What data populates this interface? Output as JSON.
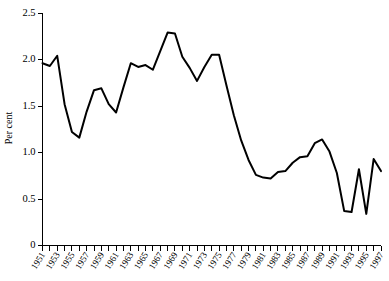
{
  "chart_data": {
    "type": "line",
    "title": "",
    "xlabel": "",
    "ylabel": "Per cent",
    "ylim": [
      0,
      2.5
    ],
    "xlim": [
      1951,
      1997
    ],
    "yticks": [
      "0",
      "0.5",
      "1.0",
      "1.5",
      "2.0",
      "2.5"
    ],
    "ytick_values": [
      0,
      0.5,
      1.0,
      1.5,
      2.0,
      2.5
    ],
    "grid": false,
    "legend": "none",
    "x": [
      1951,
      1952,
      1953,
      1954,
      1955,
      1956,
      1957,
      1958,
      1959,
      1960,
      1961,
      1962,
      1963,
      1964,
      1965,
      1966,
      1967,
      1968,
      1969,
      1970,
      1971,
      1972,
      1973,
      1974,
      1975,
      1976,
      1977,
      1978,
      1979,
      1980,
      1981,
      1982,
      1983,
      1984,
      1985,
      1986,
      1987,
      1988,
      1989,
      1990,
      1991,
      1992,
      1993,
      1994,
      1995,
      1996,
      1997
    ],
    "values": [
      1.96,
      1.93,
      2.04,
      1.52,
      1.22,
      1.16,
      1.44,
      1.67,
      1.69,
      1.52,
      1.43,
      1.7,
      1.96,
      1.92,
      1.94,
      1.89,
      2.09,
      2.29,
      2.28,
      2.03,
      1.91,
      1.77,
      1.92,
      2.05,
      2.05,
      1.72,
      1.4,
      1.13,
      0.92,
      0.76,
      0.73,
      0.72,
      0.79,
      0.8,
      0.89,
      0.95,
      0.96,
      1.1,
      1.14,
      1.01,
      0.78,
      0.37,
      0.36,
      0.82,
      0.34,
      0.93,
      0.8
    ],
    "series_note": "single unlabeled black line series",
    "xtick_labels": [
      "1951",
      "1953",
      "1955",
      "1957",
      "1959",
      "1961",
      "1963",
      "1965",
      "1967",
      "1969",
      "1971",
      "1973",
      "1975",
      "1977",
      "1979",
      "1981",
      "1983",
      "1985",
      "1987",
      "1989",
      "1991",
      "1993",
      "1995",
      "1997"
    ],
    "xtick_label_years": [
      1951,
      1953,
      1955,
      1957,
      1959,
      1961,
      1963,
      1965,
      1967,
      1969,
      1971,
      1973,
      1975,
      1977,
      1979,
      1981,
      1983,
      1985,
      1987,
      1989,
      1991,
      1993,
      1995,
      1997
    ],
    "colors": {
      "line": "#000000",
      "axis": "#000000",
      "background": "#ffffff"
    }
  }
}
